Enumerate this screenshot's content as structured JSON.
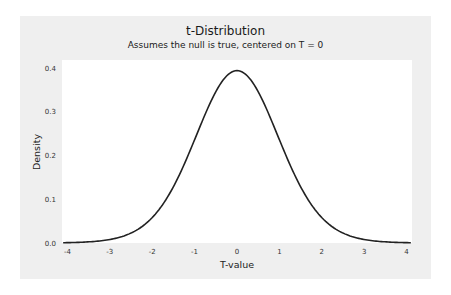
{
  "chart_data": {
    "type": "line",
    "title": "t-Distribution",
    "subtitle": "Assumes the null is true, centered on T = 0",
    "xlabel": "T-value",
    "ylabel": "Density",
    "xlim": [
      -4.1,
      4.1
    ],
    "ylim": [
      0,
      0.42
    ],
    "x_ticks": [
      -4,
      -3,
      -2,
      -1,
      0,
      1,
      2,
      3,
      4
    ],
    "y_ticks": [
      "0.0",
      "0.1",
      "0.2",
      "0.3",
      "0.4"
    ],
    "grid": false,
    "legend": null,
    "series": [
      {
        "name": "t-distribution density",
        "distribution": "Student t",
        "df": 20,
        "color": "#222222",
        "x": [
          -4,
          -3.5,
          -3,
          -2.5,
          -2,
          -1.5,
          -1,
          -0.5,
          0,
          0.5,
          1,
          1.5,
          2,
          2.5,
          3,
          3.5,
          4
        ],
        "y": [
          0.0014,
          0.0035,
          0.0087,
          0.0203,
          0.0581,
          0.1267,
          0.236,
          0.3464,
          0.394,
          0.3464,
          0.236,
          0.1267,
          0.0581,
          0.0203,
          0.0087,
          0.0035,
          0.0014
        ]
      }
    ]
  },
  "colors": {
    "panel_bg": "#efefef",
    "plot_bg": "#ffffff",
    "curve": "#222222"
  }
}
